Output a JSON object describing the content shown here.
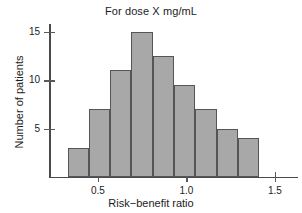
{
  "chart_data": {
    "type": "bar",
    "title": "For dose X mg/mL",
    "xlabel": "Risk−benefit ratio",
    "ylabel": "Number of patients",
    "grid": false,
    "legend": null,
    "xlim": [
      0.23,
      1.63
    ],
    "ylim": [
      0,
      15.8
    ],
    "bin_width": 0.12,
    "bin_starts": [
      0.33,
      0.45,
      0.57,
      0.69,
      0.81,
      0.93,
      1.05,
      1.17,
      1.29
    ],
    "categories": [
      "0.33-0.45",
      "0.45-0.57",
      "0.57-0.69",
      "0.69-0.81",
      "0.81-0.93",
      "0.93-1.05",
      "1.05-1.17",
      "1.17-1.29",
      "1.29-1.41"
    ],
    "values": [
      3,
      7,
      11,
      15,
      12.5,
      9.5,
      7,
      5,
      4
    ],
    "xticks": [
      0.5,
      1.0,
      1.5
    ],
    "xtick_labels": [
      "0.5",
      "1.0",
      "1.5"
    ],
    "yticks": [
      5,
      10,
      15
    ],
    "ytick_labels": [
      "5",
      "10",
      "15"
    ],
    "bar_color": "#a8a8a8",
    "bar_edge_color": "#555555",
    "axis_color": "#4a4a4a"
  }
}
